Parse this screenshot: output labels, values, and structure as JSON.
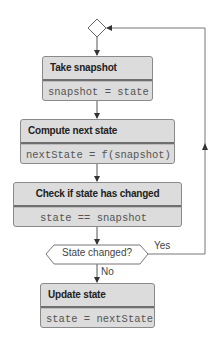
{
  "diagram": {
    "type": "flowchart",
    "nodes": [
      {
        "id": "merge",
        "shape": "diamond",
        "label": ""
      },
      {
        "id": "take_snapshot",
        "shape": "box",
        "title": "Take snapshot",
        "code": "snapshot = state"
      },
      {
        "id": "compute_next",
        "shape": "box",
        "title": "Compute next state",
        "code": "nextState = f(snapshot)"
      },
      {
        "id": "check_changed",
        "shape": "box",
        "title": "Check if state has changed",
        "code": "state == snapshot"
      },
      {
        "id": "decision",
        "shape": "hexagon",
        "label": "State changed?"
      },
      {
        "id": "update_state",
        "shape": "box",
        "title": "Update state",
        "code": "state = nextState"
      }
    ],
    "edges": [
      {
        "from": "merge",
        "to": "take_snapshot",
        "label": ""
      },
      {
        "from": "take_snapshot",
        "to": "compute_next",
        "label": ""
      },
      {
        "from": "compute_next",
        "to": "check_changed",
        "label": ""
      },
      {
        "from": "check_changed",
        "to": "decision",
        "label": ""
      },
      {
        "from": "decision",
        "to": "update_state",
        "label": "No"
      },
      {
        "from": "decision",
        "to": "merge",
        "label": "Yes"
      }
    ]
  },
  "boxes": {
    "take_snapshot": {
      "title": "Take snapshot",
      "code": "snapshot = state"
    },
    "compute_next": {
      "title": "Compute next state",
      "code": "nextState = f(snapshot)"
    },
    "check_changed": {
      "title": "Check if state has changed",
      "code": "state == snapshot"
    },
    "update_state": {
      "title": "Update state",
      "code": "state = nextState"
    }
  },
  "decision": {
    "label": "State changed?",
    "yes_label": "Yes",
    "no_label": "No"
  },
  "colors": {
    "box_fill": "#dcdcdc",
    "box_border": "#8a8a8a",
    "divider": "#6f6f6f",
    "line": "#555555",
    "text": "#222222"
  }
}
